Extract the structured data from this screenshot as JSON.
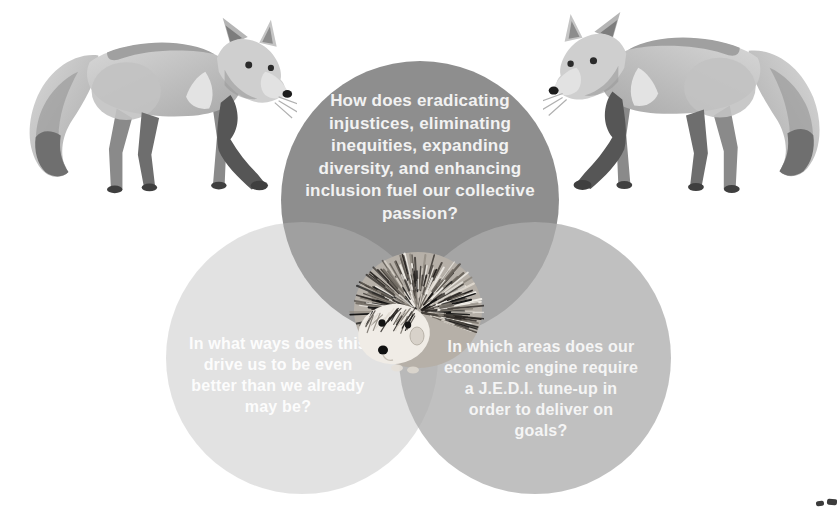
{
  "page": {
    "background": "#ffffff"
  },
  "venn": {
    "top": {
      "text": "How does eradicating\ninjustices, eliminating\ninequities, expanding\ndiversity, and enhancing\ninclusion fuel our collective\npassion?",
      "fill": "#8e8e8e",
      "text_color": "#f2f2f2"
    },
    "left": {
      "text": "In what ways does this\ndrive us to be even\nbetter than we already\nmay be?",
      "fill": "#e2e2e2",
      "text_color": "#fcfcfc"
    },
    "right": {
      "text": "In which areas does our\neconomic engine require\na J.E.D.I. tune-up in\norder to deliver on\ngoals?",
      "fill": "#c0c0c0",
      "text_color": "#f5f5f5"
    },
    "overlap_colors": {
      "top_left": "#a0a0a0",
      "top_right": "#a5a5a5",
      "left_right": "#b9b9b9",
      "center": "#a9a9a9"
    }
  },
  "illustrations": {
    "left_fox": {
      "name": "grayscale watercolor fox walking, facing right",
      "primary_gray": "#c6c6c6"
    },
    "right_fox": {
      "name": "grayscale watercolor fox walking, facing left (mirrored)",
      "primary_gray": "#c6c6c6"
    },
    "hedgehog": {
      "name": "grayscale photo of hedgehog at venn center",
      "quill_dark": "#2a2622",
      "face_light": "#f0ece6"
    }
  }
}
